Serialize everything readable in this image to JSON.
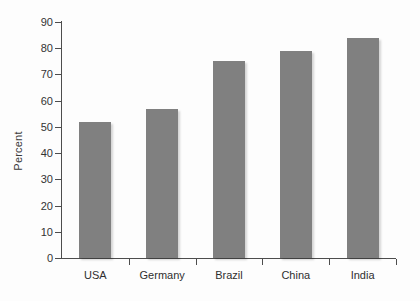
{
  "chart_data": {
    "type": "bar",
    "title": "",
    "xlabel": "",
    "ylabel": "Percent",
    "categories": [
      "USA",
      "Germany",
      "Brazil",
      "China",
      "India"
    ],
    "values": [
      52,
      57,
      75,
      79,
      84
    ],
    "ylim": [
      0,
      90
    ],
    "ytick_values": [
      0,
      10,
      20,
      30,
      40,
      50,
      60,
      70,
      80,
      90
    ],
    "ytick_labels": [
      "0",
      "10",
      "20",
      "30",
      "40",
      "50",
      "60",
      "70",
      "80",
      "90"
    ],
    "grid": false,
    "legend": null,
    "bar_color": "#808080",
    "axis_color": "#4d4d4d",
    "background_color": "#fdfdfd",
    "series": [
      {
        "name": "Percent",
        "values": [
          52,
          57,
          75,
          79,
          84
        ]
      }
    ]
  }
}
